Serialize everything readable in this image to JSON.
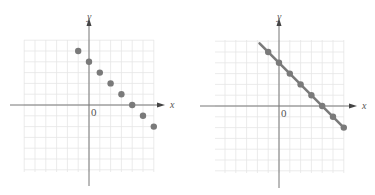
{
  "figure": {
    "panels": [
      {
        "id": "left",
        "description": "scatter of discrete points",
        "x_axis_label": "x",
        "y_axis_label": "y",
        "origin_label": "0",
        "show_line": false
      },
      {
        "id": "right",
        "description": "same points joined by a straight line",
        "x_axis_label": "x",
        "y_axis_label": "y",
        "origin_label": "0",
        "show_line": true
      }
    ],
    "colors": {
      "point": "#7a7a7a",
      "line": "#7a7a7a",
      "axis": "#777777",
      "grid": "#e6e6e6"
    }
  },
  "chart_data": [
    {
      "type": "scatter",
      "title": "",
      "xlabel": "x",
      "ylabel": "y",
      "x": [
        -1,
        0,
        1,
        2,
        3,
        4,
        5,
        6
      ],
      "y": [
        5,
        4,
        3,
        2,
        1,
        0,
        -1,
        -2
      ],
      "grid": true,
      "xlim": [
        -6,
        6
      ],
      "ylim": [
        -6,
        6
      ]
    },
    {
      "type": "line",
      "title": "",
      "xlabel": "x",
      "ylabel": "y",
      "x": [
        -1,
        0,
        1,
        2,
        3,
        4,
        5,
        6
      ],
      "y": [
        5,
        4,
        3,
        2,
        1,
        0,
        -1,
        -2
      ],
      "line": {
        "equation": "y = 4 - x",
        "x_start": -1.8,
        "x_end": 6
      },
      "grid": true,
      "xlim": [
        -6,
        6
      ],
      "ylim": [
        -6,
        6
      ]
    }
  ]
}
